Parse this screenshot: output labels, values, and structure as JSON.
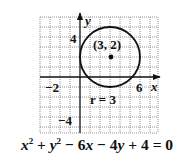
{
  "figure": {
    "grid": {
      "xmin": -4,
      "xmax": 7.8,
      "ymin": -5.6,
      "ymax": 6,
      "step": 1,
      "style": "dotted"
    },
    "axes": {
      "x_label": "x",
      "y_label": "y"
    },
    "tick_labels": {
      "x_neg2": "−2",
      "x_6": "6",
      "y_4": "4",
      "y_neg4": "−4"
    },
    "circle": {
      "center_x": 3,
      "center_y": 2,
      "radius": 3
    },
    "center_label": "(3, 2)",
    "radius_label": "r = 3",
    "equation": {
      "t1": "x",
      "e1": "2",
      "op1": " + ",
      "t2": "y",
      "e2": "2",
      "op2": " − 6",
      "t3": "x",
      "op3": " − 4",
      "t4": "y",
      "rest": " + 4 = 0"
    }
  }
}
